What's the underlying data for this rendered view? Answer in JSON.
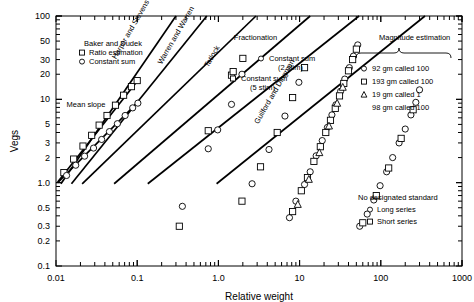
{
  "chart_data": {
    "type": "scatter",
    "title": "",
    "xlabel": "Relative weight",
    "ylabel": "Vegs",
    "xscale": "log",
    "yscale": "log",
    "xlim": [
      0.01,
      1000
    ],
    "ylim": [
      0.1,
      100
    ],
    "grid": false,
    "xticklabels": [
      "0.01",
      "0.1",
      "1.0",
      "10",
      "100",
      "1000"
    ],
    "xtickvalues": [
      0.01,
      0.1,
      1.0,
      10,
      100,
      1000
    ],
    "yticklabels": [
      "0.1",
      "0.2",
      "0.3",
      "0.5",
      "1.0",
      "2",
      "3",
      "5",
      "10",
      "20",
      "30",
      "50",
      "100"
    ],
    "ytickvalues": [
      0.1,
      0.2,
      0.3,
      0.5,
      1.0,
      2,
      3,
      5,
      10,
      20,
      30,
      50,
      100
    ],
    "annotations": [
      {
        "text": "Mean slope",
        "x": 0.0135,
        "y": 8.2,
        "rotation": 0
      },
      {
        "text": "Harper and Stevens",
        "x": 0.055,
        "y": 30,
        "rotation": -60
      },
      {
        "text": "Warren and Warren",
        "x": 0.2,
        "y": 26,
        "rotation": -60
      },
      {
        "text": "Tatlock",
        "x": 0.75,
        "y": 24,
        "rotation": -60
      },
      {
        "text": "Guilford and Dingman",
        "x": 3.1,
        "y": 5.0,
        "rotation": -60
      },
      {
        "text": "Fractionation",
        "x": 1.55,
        "y": 52,
        "rotation": 0
      },
      {
        "text": "Magnitude estimation",
        "x": 95,
        "y": 52,
        "rotation": 0
      }
    ],
    "series": [
      {
        "name": "Baker and Dudek — Ratio estimation",
        "marker": "square",
        "fit_line": {
          "x0": 0.0105,
          "y0": 1.02,
          "x1": 0.105,
          "y1": 17.5
        },
        "points": [
          {
            "x": 0.0125,
            "y": 1.32
          },
          {
            "x": 0.0165,
            "y": 1.92
          },
          {
            "x": 0.0215,
            "y": 2.75
          },
          {
            "x": 0.0275,
            "y": 3.7
          },
          {
            "x": 0.034,
            "y": 4.9
          },
          {
            "x": 0.0425,
            "y": 6.4
          },
          {
            "x": 0.054,
            "y": 8.5
          },
          {
            "x": 0.068,
            "y": 11.2
          },
          {
            "x": 0.085,
            "y": 14.2
          },
          {
            "x": 0.1,
            "y": 16.8
          }
        ]
      },
      {
        "name": "Baker and Dudek — Constant sum",
        "marker": "circle",
        "fit_line": {
          "x0": 0.0105,
          "y0": 1.0,
          "x1": 0.105,
          "y1": 9.5
        },
        "points": [
          {
            "x": 0.0135,
            "y": 1.22
          },
          {
            "x": 0.0175,
            "y": 1.62
          },
          {
            "x": 0.0225,
            "y": 2.08
          },
          {
            "x": 0.029,
            "y": 2.6
          },
          {
            "x": 0.0365,
            "y": 3.3
          },
          {
            "x": 0.0455,
            "y": 4.1
          },
          {
            "x": 0.057,
            "y": 5.1
          },
          {
            "x": 0.071,
            "y": 6.4
          },
          {
            "x": 0.088,
            "y": 7.9
          },
          {
            "x": 0.102,
            "y": 9.0
          }
        ]
      },
      {
        "name": "Harper and Stevens",
        "marker": "none",
        "fit_line": {
          "x0": 0.0115,
          "y0": 0.97,
          "x1": 0.3,
          "y1": 100
        }
      },
      {
        "name": "Warren and Warren",
        "marker": "none",
        "fit_line": {
          "x0": 0.0155,
          "y0": 0.97,
          "x1": 0.72,
          "y1": 100
        }
      },
      {
        "name": "Tatlock — Constant sum (5 stim)",
        "marker": "square",
        "fit_line": {
          "x0": 0.021,
          "y0": 0.97,
          "x1": 2.9,
          "y1": 100
        },
        "points": [
          {
            "x": 0.33,
            "y": 0.3
          },
          {
            "x": 0.75,
            "y": 4.2
          },
          {
            "x": 1.45,
            "y": 19.5
          },
          {
            "x": 1.52,
            "y": 21.5
          },
          {
            "x": 2.0,
            "y": 31
          }
        ]
      },
      {
        "name": "Fractionation — Constant sum (2 stim)",
        "marker": "circle",
        "points": [
          {
            "x": 0.36,
            "y": 0.52
          },
          {
            "x": 0.75,
            "y": 2.55
          },
          {
            "x": 0.98,
            "y": 4.3
          },
          {
            "x": 1.45,
            "y": 8.7
          },
          {
            "x": 1.95,
            "y": 20
          }
        ]
      },
      {
        "name": "Guilford and Dingman",
        "marker": "mixed",
        "fit_line": {
          "x0": 0.052,
          "y0": 0.97,
          "x1": 13.5,
          "y1": 100
        },
        "points": [
          {
            "x": 1.95,
            "y": 0.6
          },
          {
            "x": 2.6,
            "y": 0.97
          },
          {
            "x": 3.3,
            "y": 1.55
          },
          {
            "x": 4.2,
            "y": 2.5
          },
          {
            "x": 5.3,
            "y": 4.0
          },
          {
            "x": 6.6,
            "y": 6.3
          },
          {
            "x": 8.2,
            "y": 10.5
          },
          {
            "x": 9.8,
            "y": 16.0
          },
          {
            "x": 11.5,
            "y": 24
          }
        ]
      },
      {
        "name": "Magnitude estimation — 92 gm called 100",
        "marker": "circle",
        "fit_line": {
          "x0": 0.135,
          "y0": 0.97,
          "x1": 54,
          "y1": 100
        },
        "points": [
          {
            "x": 7.5,
            "y": 0.38
          },
          {
            "x": 9.0,
            "y": 0.6
          },
          {
            "x": 11.5,
            "y": 0.95
          },
          {
            "x": 13.5,
            "y": 1.35
          },
          {
            "x": 16,
            "y": 2.1
          },
          {
            "x": 19,
            "y": 3.2
          },
          {
            "x": 22,
            "y": 4.6
          },
          {
            "x": 25,
            "y": 6.5
          },
          {
            "x": 28,
            "y": 8.6
          },
          {
            "x": 32,
            "y": 12.5
          },
          {
            "x": 36,
            "y": 17.5
          },
          {
            "x": 41,
            "y": 24
          },
          {
            "x": 46,
            "y": 33
          },
          {
            "x": 52,
            "y": 45
          }
        ]
      },
      {
        "name": "Magnitude estimation — 193 gm called 100",
        "marker": "square",
        "points": [
          {
            "x": 8.2,
            "y": 0.45
          },
          {
            "x": 10.5,
            "y": 0.8
          },
          {
            "x": 12.5,
            "y": 1.15
          },
          {
            "x": 15,
            "y": 1.8
          },
          {
            "x": 18,
            "y": 2.7
          },
          {
            "x": 21,
            "y": 4.0
          },
          {
            "x": 24,
            "y": 5.6
          },
          {
            "x": 27.5,
            "y": 7.8
          },
          {
            "x": 31,
            "y": 11.0
          },
          {
            "x": 35,
            "y": 15.5
          },
          {
            "x": 40,
            "y": 22
          },
          {
            "x": 45,
            "y": 30
          },
          {
            "x": 50,
            "y": 40
          }
        ]
      },
      {
        "name": "Magnitude estimation — 19 gm called 1",
        "marker": "triangle",
        "points": [
          {
            "x": 9.5,
            "y": 0.55
          },
          {
            "x": 13,
            "y": 1.1
          },
          {
            "x": 17.5,
            "y": 2.3
          },
          {
            "x": 23,
            "y": 4.8
          },
          {
            "x": 29,
            "y": 9.0
          },
          {
            "x": 34,
            "y": 14
          }
        ]
      },
      {
        "name": "98 gm called 100",
        "marker": "none",
        "points": []
      },
      {
        "name": "No designated standard — Long series",
        "marker": "circle",
        "fit_line": {
          "x0": 0.95,
          "y0": 0.97,
          "x1": 350,
          "y1": 100
        },
        "points": [
          {
            "x": 55,
            "y": 0.3
          },
          {
            "x": 68,
            "y": 0.42
          },
          {
            "x": 82,
            "y": 0.62
          },
          {
            "x": 98,
            "y": 0.92
          },
          {
            "x": 118,
            "y": 1.35
          },
          {
            "x": 140,
            "y": 2.0
          },
          {
            "x": 168,
            "y": 3.0
          },
          {
            "x": 200,
            "y": 4.4
          },
          {
            "x": 235,
            "y": 6.5
          },
          {
            "x": 270,
            "y": 9.2
          },
          {
            "x": 300,
            "y": 13.0
          }
        ]
      },
      {
        "name": "No designated standard — Short series",
        "marker": "square",
        "points": [
          {
            "x": 60,
            "y": 0.33
          },
          {
            "x": 88,
            "y": 0.7
          },
          {
            "x": 125,
            "y": 1.5
          },
          {
            "x": 178,
            "y": 3.4
          },
          {
            "x": 250,
            "y": 7.5
          }
        ]
      }
    ]
  },
  "legends": {
    "baker_dudek": {
      "title": "Baker and Dudek",
      "items": [
        {
          "marker": "square",
          "label": "Ratio estimation"
        },
        {
          "marker": "circle",
          "label": "Constant sum"
        }
      ]
    },
    "fractionation": {
      "title": "Fractionation",
      "items": [
        {
          "marker": "circle",
          "label": "Constant sum",
          "label2": "(2 stim)"
        },
        {
          "marker": "square",
          "label": "Constant sum",
          "label2": "(5 stim)"
        }
      ]
    },
    "magnitude_estimation": {
      "title": "Magnitude estimation",
      "items": [
        {
          "marker": "circle",
          "label": "92 gm called 100"
        },
        {
          "marker": "square",
          "label": "193 gm called 100"
        },
        {
          "marker": "triangle",
          "label": "19 gm called 1"
        },
        {
          "marker": "none",
          "label": "98 gm called 100"
        }
      ]
    },
    "no_standard": {
      "title": "No designated standard",
      "items": [
        {
          "marker": "circle",
          "label": "Long series"
        },
        {
          "marker": "square",
          "label": "Short series"
        }
      ]
    }
  },
  "colors": {
    "axis": "#000000",
    "line": "#000000",
    "marker_stroke": "#000000",
    "background": "#ffffff"
  }
}
